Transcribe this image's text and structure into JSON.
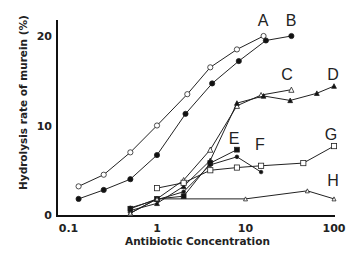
{
  "chart_data": {
    "type": "line",
    "title": "",
    "xlabel": "Antibiotic Concentration",
    "ylabel": "Hydrolysis rate of murein (%)",
    "xscale": "log",
    "xlim": [
      0.08,
      110
    ],
    "ylim": [
      0,
      21
    ],
    "xticks": [
      0.1,
      1,
      10,
      100
    ],
    "xtick_labels": [
      "0.1",
      "1",
      "10",
      "100"
    ],
    "yticks": [
      0,
      10,
      20
    ],
    "ytick_labels": [
      "0",
      "10",
      "20"
    ],
    "grid": false,
    "legend": "inline labels",
    "series": [
      {
        "name": "A",
        "marker": "open-circle",
        "label_pos": [
          0,
          0
        ],
        "x": [
          0.13,
          0.25,
          0.5,
          1,
          2.2,
          4,
          8,
          16
        ],
        "y": [
          3.2,
          4.5,
          7.0,
          10.0,
          13.5,
          16.5,
          18.5,
          20.0
        ]
      },
      {
        "name": "B",
        "marker": "filled-circle",
        "x": [
          0.13,
          0.25,
          0.5,
          1,
          2.1,
          4.2,
          8.4,
          17,
          33
        ],
        "y": [
          1.8,
          2.8,
          4.0,
          6.7,
          11.3,
          14.7,
          17.2,
          19.5,
          20.0
        ]
      },
      {
        "name": "C",
        "marker": "open-triangle",
        "x": [
          0.5,
          1,
          2,
          4,
          8,
          15,
          33
        ],
        "y": [
          0.2,
          1.8,
          3.9,
          7.3,
          12.2,
          13.4,
          14.0
        ]
      },
      {
        "name": "D",
        "marker": "filled-triangle",
        "x": [
          0.5,
          1,
          2,
          4,
          8,
          16,
          32,
          64,
          100
        ],
        "y": [
          0.5,
          1.3,
          3.2,
          6.1,
          12.5,
          13.3,
          12.8,
          13.6,
          14.4
        ]
      },
      {
        "name": "E",
        "marker": "filled-square",
        "x": [
          0.5,
          1,
          2,
          4,
          8
        ],
        "y": [
          0.7,
          1.8,
          2.1,
          5.8,
          7.3
        ]
      },
      {
        "name": "F",
        "marker": "filled-dot",
        "x": [
          0.5,
          1,
          2,
          4,
          8,
          15
        ],
        "y": [
          0.8,
          1.7,
          2.6,
          5.6,
          6.5,
          4.8
        ]
      },
      {
        "name": "G",
        "marker": "open-square",
        "x": [
          1,
          2,
          4,
          8,
          15,
          45,
          100
        ],
        "y": [
          3.0,
          3.6,
          5.0,
          5.3,
          5.5,
          5.8,
          7.7
        ]
      },
      {
        "name": "H",
        "marker": "open-small-triangle",
        "x": [
          0.5,
          1,
          10,
          50,
          100
        ],
        "y": [
          0.2,
          1.8,
          1.8,
          2.7,
          1.8
        ]
      }
    ]
  },
  "labels": {
    "A": {
      "text": "A",
      "x": 263,
      "y": 26
    },
    "B": {
      "text": "B",
      "x": 291,
      "y": 26
    },
    "C": {
      "text": "C",
      "x": 287,
      "y": 80
    },
    "D": {
      "text": "D",
      "x": 333,
      "y": 80
    },
    "E": {
      "text": "E",
      "x": 234,
      "y": 144
    },
    "F": {
      "text": "F",
      "x": 260,
      "y": 150
    },
    "G": {
      "text": "G",
      "x": 331,
      "y": 140
    },
    "H": {
      "text": "H",
      "x": 333,
      "y": 186
    }
  }
}
